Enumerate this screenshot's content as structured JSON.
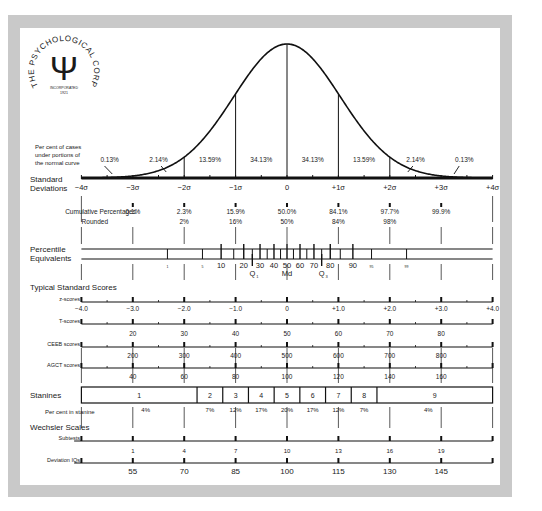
{
  "logo": {
    "ring_text": "THE PSYCHOLOGICAL CORPORATION",
    "glyph": "Ψ",
    "sub_text_1": "INCORPORATED",
    "sub_text_2": "1921"
  },
  "labels": {
    "per_cent_cases": [
      "Per cent of cases",
      "under portions of",
      "the normal curve"
    ],
    "standard_deviations": [
      "Standard",
      "Deviations"
    ],
    "cumulative": "Cumulative Percentages",
    "rounded": "Rounded",
    "percentile": [
      "Percentile",
      "Equivalents"
    ],
    "typical_scores": "Typical Standard Scores",
    "z_scores": "z-scores",
    "t_scores": "T-scores",
    "ceeb_scores": "CEEB scores",
    "agct_scores": "AGCT scores",
    "stanines": "Stanines",
    "per_cent_stanine": "Per cent in stanine",
    "wechsler": "Wechsler Scales",
    "subtests": "Subtests",
    "deviation_iqs": "Deviation IQs",
    "q1": "Q",
    "q1_sub": "1",
    "md": "Md",
    "q3": "Q",
    "q3_sub": "3"
  },
  "chart_data": {
    "type": "line",
    "xlabel": "Standard Deviations",
    "x": [
      -4,
      -3,
      -2,
      -1,
      0,
      1,
      2,
      3,
      4
    ],
    "sigma_labels": [
      "−4σ",
      "−3σ",
      "−2σ",
      "−1σ",
      "0",
      "+1σ",
      "+2σ",
      "+3σ",
      "+4σ"
    ],
    "area_percentages": [
      "0.13%",
      "2.14%",
      "13.59%",
      "34.13%",
      "34.13%",
      "13.59%",
      "2.14%",
      "0.13%"
    ],
    "cumulative_percentages": [
      "0.1%",
      "2.3%",
      "15.9%",
      "50.0%",
      "84.1%",
      "97.7%",
      "99.9%"
    ],
    "cumulative_rounded": [
      "2%",
      "16%",
      "50%",
      "84%",
      "98%"
    ],
    "percentile_equivalents": [
      1,
      5,
      10,
      20,
      30,
      40,
      50,
      60,
      70,
      80,
      90,
      95,
      99
    ],
    "percentile_ticks": [
      1,
      5,
      10,
      15,
      20,
      25,
      30,
      35,
      40,
      45,
      50,
      55,
      60,
      65,
      70,
      75,
      80,
      85,
      90,
      95,
      99
    ],
    "z_scores": [
      "−4.0",
      "−3.0",
      "−2.0",
      "−1.0",
      "0",
      "+1.0",
      "+2.0",
      "+3.0",
      "+4.0"
    ],
    "t_scores": [
      "20",
      "30",
      "40",
      "50",
      "60",
      "70",
      "80"
    ],
    "ceeb_scores": [
      "200",
      "300",
      "400",
      "500",
      "600",
      "700",
      "800"
    ],
    "agct_scores": [
      "40",
      "60",
      "80",
      "100",
      "120",
      "140",
      "160"
    ],
    "stanines": [
      "1",
      "2",
      "3",
      "4",
      "5",
      "6",
      "7",
      "8",
      "9"
    ],
    "stanine_percents": [
      "4%",
      "7%",
      "12%",
      "17%",
      "20%",
      "17%",
      "12%",
      "7%",
      "4%"
    ],
    "wechsler_subtests": [
      "1",
      "4",
      "7",
      "10",
      "13",
      "16",
      "19"
    ],
    "deviation_iqs": [
      "55",
      "70",
      "85",
      "100",
      "115",
      "130",
      "145"
    ],
    "xlim": [
      -4,
      4
    ],
    "grid": false,
    "legend": "none"
  }
}
